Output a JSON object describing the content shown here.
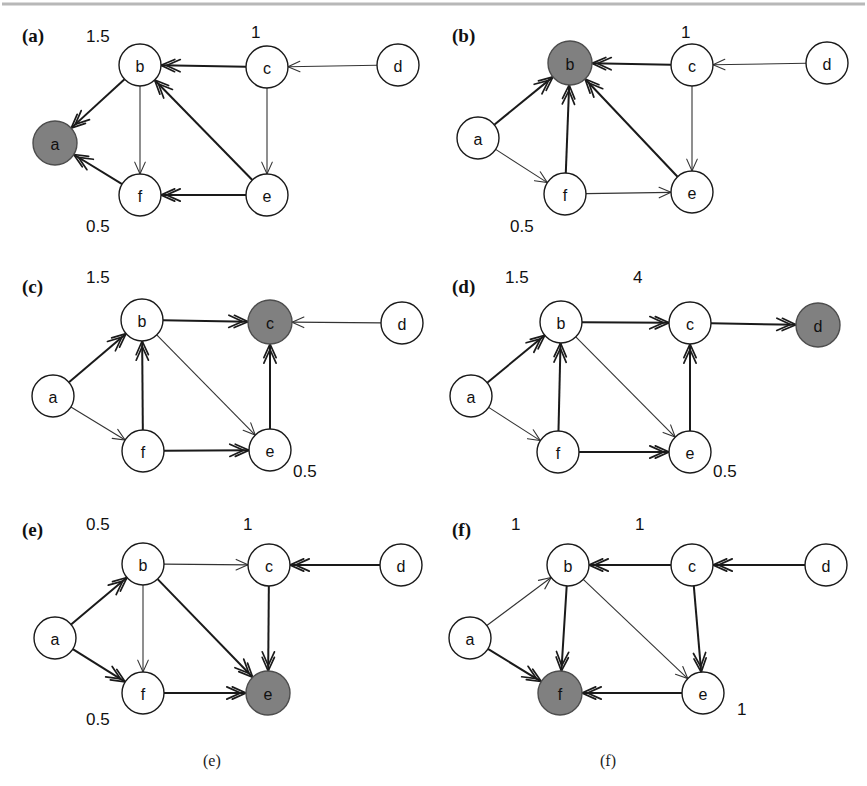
{
  "figure": {
    "width": 867,
    "height": 786,
    "background": "#ffffff",
    "node_fill_plain": "#ffffff",
    "node_fill_highlight": "#808080",
    "stroke_color": "#1a1a1a",
    "top_rule_color": "#b8b8b8"
  },
  "chart_data": {
    "type": "diagram",
    "title": "",
    "node_ids": [
      "a",
      "b",
      "c",
      "d",
      "e",
      "f"
    ],
    "panels": [
      {
        "tag": "(a)",
        "highlight": "a",
        "caption": "",
        "weights": [
          {
            "text": "1.5",
            "near": "b"
          },
          {
            "text": "1",
            "near": "c"
          },
          {
            "text": "0.5",
            "near": "f"
          }
        ],
        "edges": [
          {
            "from": "b",
            "to": "a",
            "weight_class": "thick"
          },
          {
            "from": "c",
            "to": "b",
            "weight_class": "thick"
          },
          {
            "from": "d",
            "to": "c",
            "weight_class": "thin"
          },
          {
            "from": "b",
            "to": "f",
            "weight_class": "thin"
          },
          {
            "from": "c",
            "to": "e",
            "weight_class": "thin"
          },
          {
            "from": "e",
            "to": "b",
            "weight_class": "thick"
          },
          {
            "from": "e",
            "to": "f",
            "weight_class": "thick"
          },
          {
            "from": "f",
            "to": "a",
            "weight_class": "thick"
          }
        ]
      },
      {
        "tag": "(b)",
        "highlight": "b",
        "caption": "",
        "weights": [
          {
            "text": "1",
            "near": "c"
          },
          {
            "text": "0.5",
            "near": "f"
          }
        ],
        "edges": [
          {
            "from": "a",
            "to": "b",
            "weight_class": "thick"
          },
          {
            "from": "c",
            "to": "b",
            "weight_class": "thick"
          },
          {
            "from": "d",
            "to": "c",
            "weight_class": "thin"
          },
          {
            "from": "f",
            "to": "b",
            "weight_class": "thick"
          },
          {
            "from": "c",
            "to": "e",
            "weight_class": "thin"
          },
          {
            "from": "e",
            "to": "b",
            "weight_class": "thick"
          },
          {
            "from": "f",
            "to": "e",
            "weight_class": "thin"
          },
          {
            "from": "a",
            "to": "f",
            "weight_class": "thin"
          }
        ]
      },
      {
        "tag": "(c)",
        "highlight": "c",
        "caption": "",
        "weights": [
          {
            "text": "1.5",
            "near": "b"
          },
          {
            "text": "0.5",
            "near": "e"
          }
        ],
        "edges": [
          {
            "from": "a",
            "to": "b",
            "weight_class": "thick"
          },
          {
            "from": "b",
            "to": "c",
            "weight_class": "thick"
          },
          {
            "from": "d",
            "to": "c",
            "weight_class": "thin"
          },
          {
            "from": "f",
            "to": "b",
            "weight_class": "thick"
          },
          {
            "from": "e",
            "to": "c",
            "weight_class": "thick"
          },
          {
            "from": "b",
            "to": "e",
            "weight_class": "thin"
          },
          {
            "from": "f",
            "to": "e",
            "weight_class": "thick"
          },
          {
            "from": "a",
            "to": "f",
            "weight_class": "thin"
          }
        ]
      },
      {
        "tag": "(d)",
        "highlight": "d",
        "caption": "",
        "weights": [
          {
            "text": "1.5",
            "near": "b"
          },
          {
            "text": "4",
            "near": "c"
          },
          {
            "text": "0.5",
            "near": "e"
          }
        ],
        "edges": [
          {
            "from": "a",
            "to": "b",
            "weight_class": "thick"
          },
          {
            "from": "b",
            "to": "c",
            "weight_class": "thick"
          },
          {
            "from": "c",
            "to": "d",
            "weight_class": "thick"
          },
          {
            "from": "f",
            "to": "b",
            "weight_class": "thick"
          },
          {
            "from": "e",
            "to": "c",
            "weight_class": "thick"
          },
          {
            "from": "b",
            "to": "e",
            "weight_class": "thin"
          },
          {
            "from": "f",
            "to": "e",
            "weight_class": "thick"
          },
          {
            "from": "a",
            "to": "f",
            "weight_class": "thin"
          }
        ]
      },
      {
        "tag": "(e)",
        "highlight": "e",
        "caption": "(e)",
        "weights": [
          {
            "text": "0.5",
            "near": "b"
          },
          {
            "text": "1",
            "near": "c"
          },
          {
            "text": "0.5",
            "near": "f"
          }
        ],
        "edges": [
          {
            "from": "a",
            "to": "b",
            "weight_class": "thick"
          },
          {
            "from": "b",
            "to": "c",
            "weight_class": "thin"
          },
          {
            "from": "d",
            "to": "c",
            "weight_class": "thick"
          },
          {
            "from": "c",
            "to": "e",
            "weight_class": "thick"
          },
          {
            "from": "b",
            "to": "e",
            "weight_class": "thick"
          },
          {
            "from": "b",
            "to": "f",
            "weight_class": "thin"
          },
          {
            "from": "f",
            "to": "e",
            "weight_class": "thick"
          },
          {
            "from": "a",
            "to": "f",
            "weight_class": "thick"
          }
        ]
      },
      {
        "tag": "(f)",
        "highlight": "f",
        "caption": "(f)",
        "weights": [
          {
            "text": "1",
            "near": "b"
          },
          {
            "text": "1",
            "near": "c"
          },
          {
            "text": "1",
            "near": "e"
          }
        ],
        "edges": [
          {
            "from": "a",
            "to": "b",
            "weight_class": "thin"
          },
          {
            "from": "c",
            "to": "b",
            "weight_class": "thick"
          },
          {
            "from": "d",
            "to": "c",
            "weight_class": "thick"
          },
          {
            "from": "b",
            "to": "f",
            "weight_class": "thick"
          },
          {
            "from": "c",
            "to": "e",
            "weight_class": "thick"
          },
          {
            "from": "b",
            "to": "e",
            "weight_class": "thin"
          },
          {
            "from": "e",
            "to": "f",
            "weight_class": "thick"
          },
          {
            "from": "a",
            "to": "f",
            "weight_class": "thick"
          }
        ]
      }
    ]
  },
  "layout": {
    "node_radius": 21,
    "highlight_radius": 22,
    "panel_origins": [
      {
        "tag": "(a)",
        "x": 0,
        "y": 0
      },
      {
        "tag": "(b)",
        "x": 430,
        "y": 0
      },
      {
        "tag": "(c)",
        "x": 0,
        "y": 255
      },
      {
        "tag": "(d)",
        "x": 430,
        "y": 255
      },
      {
        "tag": "(e)",
        "x": 0,
        "y": 498
      },
      {
        "tag": "(f)",
        "x": 430,
        "y": 498
      }
    ],
    "node_offsets": {
      "(a)": {
        "a": [
          55,
          143
        ],
        "b": [
          140,
          65
        ],
        "c": [
          267,
          67
        ],
        "d": [
          398,
          65
        ],
        "e": [
          267,
          195
        ],
        "f": [
          140,
          195
        ]
      },
      "(b)": {
        "a": [
          48,
          138
        ],
        "b": [
          140,
          63
        ],
        "c": [
          262,
          65
        ],
        "d": [
          397,
          63
        ],
        "e": [
          262,
          192
        ],
        "f": [
          135,
          194
        ]
      },
      "(c)": {
        "a": [
          53,
          141
        ],
        "b": [
          142,
          65
        ],
        "c": [
          270,
          67
        ],
        "d": [
          402,
          68
        ],
        "e": [
          270,
          195
        ],
        "f": [
          143,
          196
        ]
      },
      "(d)": {
        "a": [
          41,
          141
        ],
        "b": [
          131,
          67
        ],
        "c": [
          260,
          68
        ],
        "d": [
          388,
          70
        ],
        "e": [
          260,
          197
        ],
        "f": [
          128,
          197
        ]
      },
      "(e)": {
        "a": [
          55,
          140
        ],
        "b": [
          143,
          66
        ],
        "c": [
          269,
          67
        ],
        "d": [
          401,
          67
        ],
        "e": [
          268,
          195
        ],
        "f": [
          143,
          195
        ]
      },
      "(f)": {
        "a": [
          40,
          140
        ],
        "b": [
          138,
          67
        ],
        "c": [
          262,
          67
        ],
        "d": [
          396,
          67
        ],
        "e": [
          273,
          195
        ],
        "f": [
          130,
          195
        ]
      }
    },
    "tag_offsets": {
      "(a)": [
        22,
        42
      ],
      "(b)": [
        22,
        42
      ],
      "(c)": [
        22,
        38
      ],
      "(d)": [
        22,
        38
      ],
      "(e)": [
        22,
        38
      ],
      "(f)": [
        22,
        38
      ]
    },
    "weight_offsets": {
      "(a)": [
        [
          86,
          42
        ],
        [
          251,
          38
        ],
        [
          86,
          232
        ]
      ],
      "(b)": [
        [
          251,
          38
        ],
        [
          80,
          232
        ]
      ],
      "(c)": [
        [
          86,
          28
        ],
        [
          293,
          222
        ]
      ],
      "(d)": [
        [
          75,
          28
        ],
        [
          203,
          28
        ],
        [
          283,
          222
        ]
      ],
      "(e)": [
        [
          86,
          32
        ],
        [
          243,
          32
        ],
        [
          86,
          227
        ]
      ],
      "(f)": [
        [
          81,
          32
        ],
        [
          205,
          32
        ],
        [
          307,
          217
        ]
      ]
    },
    "caption_offsets": {
      "(e)": [
        203,
        268
      ],
      "(f)": [
        170,
        268
      ]
    }
  }
}
